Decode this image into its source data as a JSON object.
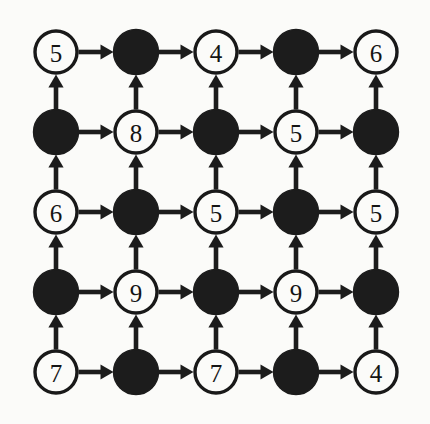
{
  "figure": {
    "title": "",
    "background_color": "#fbfbf9",
    "ink_color": "#1c1c1c",
    "node_open_fill": "#fbfbf9",
    "node_filled_fill": "#1c1c1c"
  },
  "chart_data": {
    "type": "diagram",
    "title": "",
    "xlabel": "",
    "ylabel": "",
    "grid": {
      "rows": 5,
      "cols": 5,
      "spacing_px": 80,
      "origin_x": 56,
      "origin_y": 52,
      "node_radius": 21
    },
    "legend": [],
    "node_styles": {
      "open": "white circle with black outline and a digit label",
      "filled": "solid black circle with no label"
    },
    "edge_rules": {
      "horizontal": "arrow pointing right, from each node to its right neighbour",
      "vertical": "arrow pointing up, from each node to the node above it"
    },
    "nodes": [
      [
        {
          "row": 1,
          "col": 1,
          "style": "open",
          "label": "5"
        },
        {
          "row": 1,
          "col": 2,
          "style": "filled",
          "label": ""
        },
        {
          "row": 1,
          "col": 3,
          "style": "open",
          "label": "4"
        },
        {
          "row": 1,
          "col": 4,
          "style": "filled",
          "label": ""
        },
        {
          "row": 1,
          "col": 5,
          "style": "open",
          "label": "6"
        }
      ],
      [
        {
          "row": 2,
          "col": 1,
          "style": "filled",
          "label": ""
        },
        {
          "row": 2,
          "col": 2,
          "style": "open",
          "label": "8"
        },
        {
          "row": 2,
          "col": 3,
          "style": "filled",
          "label": ""
        },
        {
          "row": 2,
          "col": 4,
          "style": "open",
          "label": "5"
        },
        {
          "row": 2,
          "col": 5,
          "style": "filled",
          "label": ""
        }
      ],
      [
        {
          "row": 3,
          "col": 1,
          "style": "open",
          "label": "6"
        },
        {
          "row": 3,
          "col": 2,
          "style": "filled",
          "label": ""
        },
        {
          "row": 3,
          "col": 3,
          "style": "open",
          "label": "5"
        },
        {
          "row": 3,
          "col": 4,
          "style": "filled",
          "label": ""
        },
        {
          "row": 3,
          "col": 5,
          "style": "open",
          "label": "5"
        }
      ],
      [
        {
          "row": 4,
          "col": 1,
          "style": "filled",
          "label": ""
        },
        {
          "row": 4,
          "col": 2,
          "style": "open",
          "label": "9"
        },
        {
          "row": 4,
          "col": 3,
          "style": "filled",
          "label": ""
        },
        {
          "row": 4,
          "col": 4,
          "style": "open",
          "label": "9"
        },
        {
          "row": 4,
          "col": 5,
          "style": "filled",
          "label": ""
        }
      ],
      [
        {
          "row": 5,
          "col": 1,
          "style": "open",
          "label": "7"
        },
        {
          "row": 5,
          "col": 2,
          "style": "filled",
          "label": ""
        },
        {
          "row": 5,
          "col": 3,
          "style": "open",
          "label": "7"
        },
        {
          "row": 5,
          "col": 4,
          "style": "filled",
          "label": ""
        },
        {
          "row": 5,
          "col": 5,
          "style": "open",
          "label": "4"
        }
      ]
    ],
    "labels_in_reading_order": [
      "5",
      "4",
      "6",
      "8",
      "5",
      "6",
      "5",
      "5",
      "9",
      "9",
      "7",
      "7",
      "4"
    ]
  }
}
